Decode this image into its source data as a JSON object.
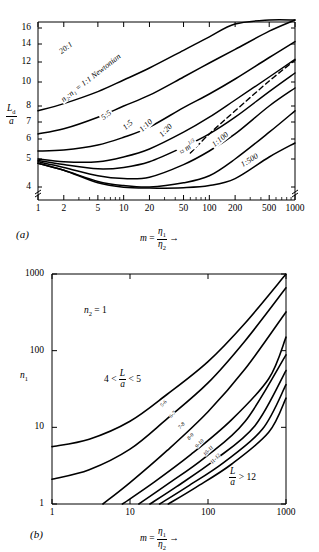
{
  "figure": {
    "panel_a": {
      "label": "(a)",
      "y_axis": {
        "title_num": "L",
        "title_num_sub": "d",
        "title_den": "a",
        "ticks": [
          {
            "value": 16,
            "label": "16"
          },
          {
            "value": 14,
            "label": "14"
          },
          {
            "value": 12,
            "label": "12"
          },
          {
            "value": 10,
            "label": "10"
          },
          {
            "value": 8,
            "label": "8"
          },
          {
            "value": 7,
            "label": "7"
          },
          {
            "value": 6,
            "label": "6"
          },
          {
            "value": 5,
            "label": "5"
          },
          {
            "value": 4,
            "label": "4"
          }
        ]
      },
      "x_axis": {
        "title_lead": "m",
        "title_eq": "=",
        "title_num": "η",
        "title_num_sub": "1",
        "title_den": "η",
        "title_den_sub": "2",
        "title_arrow": "→",
        "ticks": [
          {
            "value": 1,
            "label": "1"
          },
          {
            "value": 2,
            "label": "2"
          },
          {
            "value": 5,
            "label": "5"
          },
          {
            "value": 10,
            "label": "10"
          },
          {
            "value": 20,
            "label": "20"
          },
          {
            "value": 50,
            "label": "50"
          },
          {
            "value": 100,
            "label": "100"
          },
          {
            "value": 200,
            "label": "200"
          },
          {
            "value": 500,
            "label": "500"
          },
          {
            "value": 1000,
            "label": "1000"
          }
        ]
      },
      "curve_labels": [
        "20:1",
        "n₂:n₁ = 1:1 Newtonian",
        "5:5",
        "1:5",
        "1:10",
        "1:20",
        "1:100",
        "1:500"
      ],
      "dashed_label_prefix": "≈ m",
      "dashed_label_exp": "1/3"
    },
    "panel_b": {
      "label": "(b)",
      "annotation_top": {
        "sym": "n",
        "sub": "2",
        "eq": "= 1"
      },
      "annotation_left": {
        "lead": "4 <",
        "num": "L",
        "den": "a",
        "tail": "< 5"
      },
      "annotation_right": {
        "num": "L",
        "den": "a",
        "tail": "> 12"
      },
      "y_axis": {
        "title": "n",
        "title_sub": "1",
        "ticks": [
          {
            "value": 1000,
            "label": "1000"
          },
          {
            "value": 100,
            "label": "100"
          },
          {
            "value": 10,
            "label": "10"
          },
          {
            "value": 1,
            "label": "1"
          }
        ]
      },
      "x_axis": {
        "title_lead": "m",
        "title_eq": "=",
        "title_num": "η",
        "title_num_sub": "1",
        "title_den": "η",
        "title_den_sub": "2",
        "title_arrow": "→",
        "ticks": [
          {
            "value": 1,
            "label": "1"
          },
          {
            "value": 10,
            "label": "10"
          },
          {
            "value": 100,
            "label": "100"
          },
          {
            "value": 1000,
            "label": "1000"
          }
        ]
      },
      "curve_labels": [
        "5-6",
        "6-7",
        "7-8",
        "8-9",
        "9-10",
        "10-11",
        "11-12"
      ]
    }
  },
  "chart_data": [
    {
      "type": "line",
      "panel": "(a)",
      "title": "",
      "xlabel": "m = η₁/η₂",
      "ylabel": "L_d / a",
      "xscale": "log",
      "yscale": "piecewise-linear-compressed",
      "xlim": [
        1,
        1000
      ],
      "ylim": [
        3.6,
        17
      ],
      "grid": false,
      "legend": "inline-curve-labels",
      "axis_breaks": [
        "y-bottom-left",
        "y-bottom-right"
      ],
      "series": [
        {
          "name": "20:1",
          "x": [
            1,
            2,
            5,
            10,
            20,
            50,
            100,
            200,
            500,
            1000
          ],
          "y": [
            7.7,
            8.2,
            9.2,
            10.2,
            11.4,
            13.3,
            14.9,
            16.5,
            17.0,
            17.0
          ]
        },
        {
          "name": "n2:n1 = 1:1 Newtonian",
          "x": [
            1,
            2,
            5,
            10,
            20,
            50,
            100,
            200,
            500,
            1000
          ],
          "y": [
            6.3,
            6.6,
            7.3,
            8.0,
            8.9,
            10.5,
            11.9,
            13.4,
            15.6,
            17.0
          ]
        },
        {
          "name": "5:5",
          "x": [
            1,
            2,
            5,
            10,
            20,
            50,
            100,
            200,
            500,
            1000
          ],
          "y": [
            5.4,
            5.45,
            5.7,
            6.1,
            6.7,
            7.9,
            9.0,
            10.3,
            12.5,
            14.3
          ]
        },
        {
          "name": "1:5",
          "x": [
            1,
            2,
            5,
            10,
            20,
            50,
            100,
            200,
            500,
            1000
          ],
          "y": [
            5.0,
            4.9,
            4.9,
            5.1,
            5.5,
            6.4,
            7.3,
            8.5,
            10.5,
            12.3
          ]
        },
        {
          "name": "1:10",
          "x": [
            1,
            2,
            5,
            10,
            20,
            50,
            100,
            200,
            500,
            1000
          ],
          "y": [
            4.95,
            4.8,
            4.65,
            4.7,
            4.9,
            5.6,
            6.3,
            7.3,
            9.2,
            10.9
          ]
        },
        {
          "name": "1:20",
          "x": [
            1,
            2,
            5,
            10,
            20,
            50,
            100,
            200,
            500,
            1000
          ],
          "y": [
            4.9,
            4.7,
            4.4,
            4.3,
            4.35,
            4.8,
            5.4,
            6.3,
            8.0,
            9.5
          ]
        },
        {
          "name": "1:100",
          "x": [
            1,
            2,
            5,
            10,
            20,
            50,
            100,
            200,
            500,
            1000
          ],
          "y": [
            4.85,
            4.6,
            4.2,
            4.05,
            4.0,
            4.15,
            4.4,
            5.0,
            6.4,
            7.7
          ]
        },
        {
          "name": "1:500",
          "x": [
            1,
            2,
            5,
            10,
            20,
            50,
            100,
            200,
            500,
            1000
          ],
          "y": [
            4.85,
            4.6,
            4.15,
            3.98,
            3.92,
            3.95,
            4.05,
            4.3,
            5.1,
            5.8
          ]
        },
        {
          "name": "≈ m^(1/3)",
          "style": "dashed",
          "x": [
            60,
            100,
            200,
            500,
            1000
          ],
          "y": [
            5.3,
            6.3,
            7.7,
            10.1,
            12.2
          ]
        }
      ]
    },
    {
      "type": "line",
      "panel": "(b)",
      "title": "",
      "xlabel": "m = η₁/η₂",
      "ylabel": "n₁",
      "xscale": "log",
      "yscale": "log",
      "xlim": [
        1,
        1000
      ],
      "ylim": [
        1,
        1000
      ],
      "grid": false,
      "legend": "inline-curve-labels",
      "annotations": [
        "n₂ = 1",
        "4 < L/a < 5",
        "L/a > 12"
      ],
      "series": [
        {
          "name": "5-6",
          "x": [
            1,
            3,
            10,
            30,
            100,
            300,
            1000
          ],
          "y": [
            5.6,
            7.0,
            12.0,
            27.0,
            72.0,
            230.0,
            1000.0
          ]
        },
        {
          "name": "6-7",
          "x": [
            1,
            3,
            10,
            30,
            100,
            300,
            1000
          ],
          "y": [
            2.1,
            2.8,
            5.2,
            13.0,
            38.0,
            135.0,
            660.0
          ]
        },
        {
          "name": "7-8",
          "x": [
            4.5,
            10,
            30,
            100,
            300,
            1000
          ],
          "y": [
            1.0,
            1.9,
            5.0,
            16.0,
            58.0,
            320.0
          ]
        },
        {
          "name": "8-9",
          "x": [
            8,
            20,
            60,
            200,
            600,
            1000
          ],
          "y": [
            1.0,
            1.9,
            4.4,
            12.5,
            43.0,
            150.0
          ]
        },
        {
          "name": "9-10",
          "x": [
            13,
            30,
            90,
            300,
            1000
          ],
          "y": [
            1.0,
            1.8,
            4.0,
            12.0,
            88.0
          ]
        },
        {
          "name": "10-11",
          "x": [
            18,
            40,
            120,
            400,
            1000
          ],
          "y": [
            1.0,
            1.7,
            3.7,
            10.5,
            55.0
          ]
        },
        {
          "name": "11-12",
          "x": [
            24,
            55,
            160,
            500,
            1000
          ],
          "y": [
            1.0,
            1.7,
            3.5,
            9.5,
            36.0
          ]
        },
        {
          "name": "12+",
          "x": [
            31,
            70,
            200,
            600,
            1000
          ],
          "y": [
            1.0,
            1.65,
            3.3,
            8.6,
            24.0
          ]
        }
      ]
    }
  ]
}
